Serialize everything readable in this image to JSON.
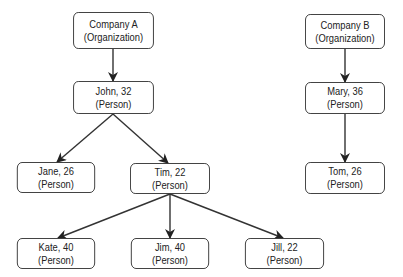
{
  "diagram": {
    "type": "tree",
    "nodes": [
      {
        "id": "companyA",
        "name": "Company A",
        "type": "(Organization)",
        "x": 66,
        "y": 12,
        "w": 95,
        "h": 37
      },
      {
        "id": "john",
        "name": "John, 32",
        "type": "(Person)",
        "x": 66,
        "y": 81,
        "w": 95,
        "h": 33
      },
      {
        "id": "jane",
        "name": "Jane, 26",
        "type": "(Person)",
        "x": 10,
        "y": 162,
        "w": 92,
        "h": 31
      },
      {
        "id": "tim",
        "name": "Tim, 22",
        "type": "(Person)",
        "x": 123,
        "y": 163,
        "w": 94,
        "h": 31
      },
      {
        "id": "kate",
        "name": "Kate, 40",
        "type": "(Person)",
        "x": 10,
        "y": 238,
        "w": 92,
        "h": 31
      },
      {
        "id": "jim",
        "name": "Jim, 40",
        "type": "(Person)",
        "x": 124,
        "y": 238,
        "w": 92,
        "h": 31
      },
      {
        "id": "jill",
        "name": "Jill, 22",
        "type": "(Person)",
        "x": 238,
        "y": 238,
        "w": 93,
        "h": 31
      },
      {
        "id": "companyB",
        "name": "Company B",
        "type": "(Organization)",
        "x": 298,
        "y": 14,
        "w": 94,
        "h": 35
      },
      {
        "id": "mary",
        "name": "Mary, 36",
        "type": "(Person)",
        "x": 298,
        "y": 82,
        "w": 94,
        "h": 32
      },
      {
        "id": "tom",
        "name": "Tom, 26",
        "type": "(Person)",
        "x": 298,
        "y": 162,
        "w": 94,
        "h": 32
      }
    ],
    "edges": [
      {
        "from": "companyA",
        "to": "john",
        "x1": 113,
        "y1": 49,
        "x2": 113,
        "y2": 81
      },
      {
        "from": "john",
        "to": "jane",
        "x1": 113,
        "y1": 114,
        "x2": 57,
        "y2": 162
      },
      {
        "from": "john",
        "to": "tim",
        "x1": 113,
        "y1": 114,
        "x2": 168,
        "y2": 163
      },
      {
        "from": "tim",
        "to": "kate",
        "x1": 170,
        "y1": 194,
        "x2": 58,
        "y2": 238
      },
      {
        "from": "tim",
        "to": "jim",
        "x1": 170,
        "y1": 194,
        "x2": 170,
        "y2": 238
      },
      {
        "from": "tim",
        "to": "jill",
        "x1": 170,
        "y1": 194,
        "x2": 283,
        "y2": 238
      },
      {
        "from": "companyB",
        "to": "mary",
        "x1": 345,
        "y1": 49,
        "x2": 345,
        "y2": 82
      },
      {
        "from": "mary",
        "to": "tom",
        "x1": 345,
        "y1": 114,
        "x2": 345,
        "y2": 162
      }
    ],
    "colors": {
      "stroke": "#333333",
      "text": "#222222",
      "background": "#ffffff"
    }
  }
}
